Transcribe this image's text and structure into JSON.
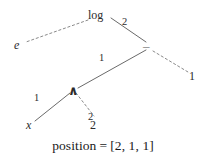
{
  "figure": {
    "type": "expression-tree-diagram",
    "background_color": "#ffffff",
    "ink_color": "#2b2b2b",
    "caption": {
      "label": "position",
      "equals": "=",
      "value": "[2, 1, 1]",
      "full_text": "position  =  [2, 1, 1]"
    }
  },
  "nodes": [
    {
      "id": "log",
      "label": "log",
      "kind": "operator",
      "x": 98,
      "y": 16
    },
    {
      "id": "e",
      "label": "e",
      "kind": "variable",
      "x": 16,
      "y": 45
    },
    {
      "id": "minus",
      "label": "–",
      "kind": "operator",
      "x": 148,
      "y": 46
    },
    {
      "id": "one_r",
      "label": "1",
      "kind": "number",
      "x": 192,
      "y": 76
    },
    {
      "id": "caret",
      "label": "∧",
      "kind": "operator",
      "x": 72,
      "y": 90
    },
    {
      "id": "x",
      "label": "x",
      "kind": "variable",
      "x": 29,
      "y": 126
    },
    {
      "id": "two_b",
      "label": "2",
      "kind": "number",
      "x": 92,
      "y": 126
    }
  ],
  "edges": [
    {
      "id": "log-e",
      "from": "log",
      "to": "e",
      "style": "dashed",
      "label": "",
      "on_path": false
    },
    {
      "id": "log-minus",
      "from": "log",
      "to": "minus",
      "style": "solid",
      "label": "2",
      "on_path": true
    },
    {
      "id": "minus-caret",
      "from": "minus",
      "to": "caret",
      "style": "solid",
      "label": "1",
      "on_path": true
    },
    {
      "id": "minus-one",
      "from": "minus",
      "to": "one_r",
      "style": "dashed",
      "label": "",
      "on_path": false
    },
    {
      "id": "caret-x",
      "from": "caret",
      "to": "x",
      "style": "solid",
      "label": "1",
      "on_path": true
    },
    {
      "id": "caret-two",
      "from": "caret",
      "to": "two_b",
      "style": "dashed",
      "label": "2",
      "on_path": false
    }
  ],
  "edge_labels": [
    {
      "id": "label-2-top",
      "text": "2",
      "x": 124,
      "y": 22
    },
    {
      "id": "label-1-middle",
      "text": "1",
      "x": 100,
      "y": 58
    },
    {
      "id": "label-1-left",
      "text": "1",
      "x": 35,
      "y": 98
    },
    {
      "id": "label-2-bottom",
      "text": "2",
      "x": 89,
      "y": 118
    }
  ],
  "caption_position": {
    "x": 0,
    "y": 136
  }
}
